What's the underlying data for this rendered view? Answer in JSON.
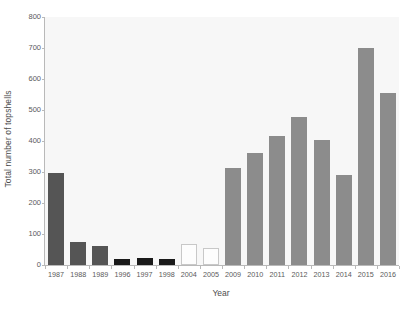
{
  "chart_data": {
    "type": "bar",
    "title": "",
    "xlabel": "Year",
    "ylabel": "Total number of topshells",
    "categories": [
      "1987",
      "1988",
      "1989",
      "1996",
      "1997",
      "1998",
      "2004",
      "2005",
      "2009",
      "2010",
      "2011",
      "2012",
      "2013",
      "2014",
      "2015",
      "2016"
    ],
    "values": [
      298,
      75,
      60,
      18,
      22,
      19,
      67,
      56,
      313,
      360,
      417,
      477,
      402,
      290,
      700,
      555
    ],
    "bar_colors": [
      "#555555",
      "#555555",
      "#555555",
      "#1a1a1a",
      "#1a1a1a",
      "#1a1a1a",
      "#fdfdfd",
      "#fdfdfd",
      "#8c8c8c",
      "#8c8c8c",
      "#8c8c8c",
      "#8c8c8c",
      "#8c8c8c",
      "#8c8c8c",
      "#8c8c8c",
      "#8c8c8c"
    ],
    "bar_borders": [
      "#555555",
      "#555555",
      "#555555",
      "#1a1a1a",
      "#1a1a1a",
      "#1a1a1a",
      "#c8c8c8",
      "#c8c8c8",
      "#8c8c8c",
      "#8c8c8c",
      "#8c8c8c",
      "#8c8c8c",
      "#8c8c8c",
      "#8c8c8c",
      "#8c8c8c",
      "#8c8c8c"
    ],
    "ylim": [
      0,
      800
    ],
    "yticks": [
      0,
      100,
      200,
      300,
      400,
      500,
      600,
      700,
      800
    ],
    "ytick_labels": [
      "0",
      "100",
      "200",
      "300",
      "400",
      "500",
      "600",
      "700",
      "800"
    ],
    "grid": false,
    "legend": null,
    "plot_background": "#f7f7f7",
    "axis_color": "#b9b9b9",
    "text_color": "#4d4d4d"
  }
}
